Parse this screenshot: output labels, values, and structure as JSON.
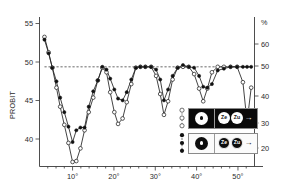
{
  "chart_data": {
    "type": "line",
    "title": "",
    "xlabel": "",
    "ylabel": "PROBIT",
    "y2label": "%",
    "xlim": [
      2,
      54
    ],
    "ylim": [
      39,
      55.5
    ],
    "y2lim": [
      15,
      64
    ],
    "grid": false,
    "reference_line": {
      "y": 50,
      "style": "dashed",
      "label": "50"
    },
    "xticks": [
      "10°",
      "20°",
      "30°",
      "40°",
      "50°"
    ],
    "xtick_values": [
      10,
      20,
      30,
      40,
      50
    ],
    "yticks": [
      "40",
      "45",
      "50",
      "55"
    ],
    "ytick_values": [
      40,
      45,
      50,
      55
    ],
    "y2ticks": [
      "20",
      "30",
      "40",
      "50",
      "60"
    ],
    "y2tick_values": [
      20,
      30,
      40,
      50,
      60
    ],
    "series": [
      {
        "name": "open-circle-series",
        "marker": "open-circle",
        "x": [
          3.2,
          4.2,
          5.1,
          6.1,
          7.0,
          8.0,
          9.0,
          10.0,
          10.9,
          11.9,
          12.9,
          13.9,
          15.0,
          16.1,
          17.2,
          18.2,
          19.1,
          20.1,
          21.0,
          22.1,
          23.1,
          24.2,
          25.3,
          26.4,
          27.6,
          29.0,
          30.2,
          31.2,
          32.1,
          33.1,
          34.2,
          35.4,
          36.7,
          38.1,
          39.4,
          40.6,
          41.6,
          42.6,
          43.7,
          45.1,
          46.6,
          48.2,
          49.8,
          51.2,
          52.2,
          53.2
        ],
        "y": [
          53.3,
          51.6,
          49.9,
          47.7,
          45.6,
          43.6,
          41.6,
          39.5,
          39.6,
          41.0,
          43.0,
          45.0,
          46.6,
          48.5,
          49.9,
          49.4,
          47.2,
          45.0,
          43.7,
          44.3,
          46.1,
          48.1,
          49.9,
          50.0,
          50.0,
          50.0,
          49.0,
          47.0,
          44.7,
          46.2,
          48.6,
          49.9,
          50.0,
          50.0,
          49.2,
          47.6,
          46.2,
          47.6,
          49.4,
          50.0,
          50.0,
          50.0,
          50.0,
          48.3,
          43.9,
          47.7
        ]
      },
      {
        "name": "filled-circle-series",
        "marker": "filled-circle",
        "x": [
          3.2,
          4.2,
          5.1,
          6.1,
          7.0,
          8.0,
          9.0,
          10.0,
          10.9,
          11.9,
          12.9,
          13.9,
          15.0,
          16.1,
          17.2,
          18.2,
          19.1,
          20.1,
          21.0,
          22.1,
          23.1,
          24.2,
          25.3,
          26.4,
          27.6,
          29.0,
          30.2,
          31.2,
          32.1,
          33.1,
          34.2,
          35.4,
          36.7,
          38.1,
          39.4,
          40.6,
          41.6,
          42.6,
          43.7,
          45.1,
          46.6,
          48.2,
          49.8,
          51.2,
          52.2,
          53.2
        ],
        "y": [
          53.0,
          51.5,
          49.9,
          48.4,
          46.6,
          45.0,
          43.4,
          41.7,
          43.0,
          43.3,
          43.3,
          45.6,
          47.3,
          48.5,
          50.0,
          49.7,
          48.7,
          47.5,
          46.5,
          46.3,
          47.2,
          48.6,
          49.9,
          50.0,
          50.0,
          50.0,
          49.7,
          48.6,
          46.3,
          47.5,
          49.0,
          49.9,
          50.2,
          50.0,
          49.9,
          49.0,
          47.8,
          47.7,
          48.1,
          49.6,
          49.8,
          50.0,
          50.0,
          50.0,
          50.0,
          50.0
        ]
      }
    ]
  },
  "legend": {
    "rows": [
      {
        "key_marker": "open-circle",
        "panel_style": "dark",
        "single_atom": {
          "label": "",
          "fill": "white",
          "core": "black-dot"
        },
        "pair": [
          {
            "label": "Ze",
            "fill": "white"
          },
          {
            "label": "Zu",
            "fill": "white"
          }
        ],
        "arrow": "→"
      },
      {
        "key_marker": "filled-circle",
        "panel_style": "light",
        "single_atom": {
          "label": "",
          "fill": "black",
          "core": "white-dot"
        },
        "pair": [
          {
            "label": "Ze",
            "fill": "black"
          },
          {
            "label": "Zu",
            "fill": "black"
          }
        ],
        "arrow": "→"
      }
    ]
  },
  "colors": {
    "axis": "#3a3a3a",
    "line": "#222222",
    "marker_fill_open": "#ffffff",
    "marker_fill_closed": "#111111",
    "background": "#ffffff",
    "legend_dark": "#0a0a0a",
    "legend_light": "#fbfbfb"
  }
}
